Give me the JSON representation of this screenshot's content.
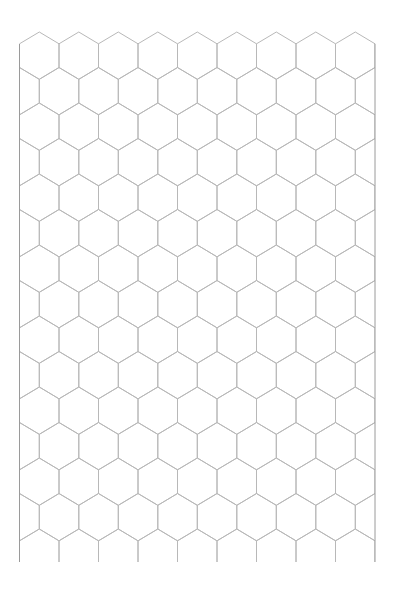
{
  "title": "PLACEMENT DIAGRAM",
  "grid": {
    "type": "hex",
    "orientation": "pointy-top",
    "columns": 9,
    "rows": 15,
    "border": {
      "left": 19.5,
      "right": 375,
      "bottom": 562
    },
    "hex_width": 39.5,
    "row_pitch": 35.5,
    "first_row_top": 32,
    "line_color": "#b8b8b8",
    "border_color": "#9a9a9a"
  }
}
